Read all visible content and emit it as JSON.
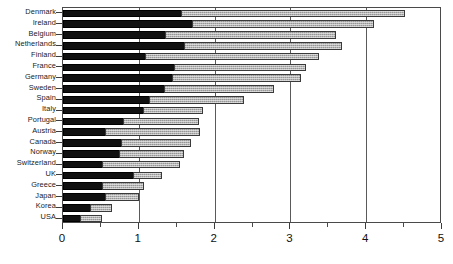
{
  "chart_data": {
    "type": "bar",
    "orientation": "horizontal",
    "stacked": true,
    "title": "",
    "subtitle": "",
    "xlabel": "",
    "ylabel": "",
    "xlim": [
      0,
      5
    ],
    "ylim": null,
    "grid": true,
    "grid_axis": "x",
    "legend": null,
    "legend_position": "none",
    "annotations": [],
    "xticks": [
      "0",
      "1",
      "2",
      "3",
      "4",
      "5"
    ],
    "xtick_values": [
      0,
      1,
      2,
      3,
      4,
      5
    ],
    "xminor_values": [
      0.5,
      1.5,
      2.5,
      3.5,
      4.5
    ],
    "categories": [
      "Denmark",
      "Ireland",
      "Belgium",
      "Netherlands",
      "Finland",
      "France",
      "Germany",
      "Sweden",
      "Spain",
      "Italy",
      "Portugal",
      "Austria",
      "Canada",
      "Norway",
      "Switzerland",
      "UK",
      "Greece",
      "Japan",
      "Korea",
      "USA"
    ],
    "series": [
      {
        "name": "series-1-dark",
        "color": "#111111",
        "values": [
          1.56,
          1.7,
          1.35,
          1.59,
          1.08,
          1.46,
          1.44,
          1.33,
          1.14,
          1.05,
          0.79,
          0.56,
          0.76,
          0.74,
          0.51,
          0.92,
          0.52,
          0.55,
          0.35,
          0.22
        ]
      },
      {
        "name": "series-2-light",
        "color": "#ababab",
        "values": [
          2.95,
          2.4,
          2.25,
          2.09,
          2.3,
          1.75,
          1.7,
          1.45,
          1.25,
          0.8,
          1.0,
          1.25,
          0.93,
          0.86,
          1.03,
          0.38,
          0.55,
          0.45,
          0.3,
          0.3
        ]
      }
    ],
    "totals": [
      4.51,
      4.1,
      3.6,
      3.68,
      3.38,
      3.21,
      3.14,
      2.78,
      2.39,
      1.85,
      1.79,
      1.81,
      1.69,
      1.6,
      1.54,
      1.3,
      1.07,
      1.0,
      0.65,
      0.52
    ]
  },
  "axes": {
    "x_axis_name": "x-axis",
    "y_axis_name": "y-axis-categories"
  }
}
